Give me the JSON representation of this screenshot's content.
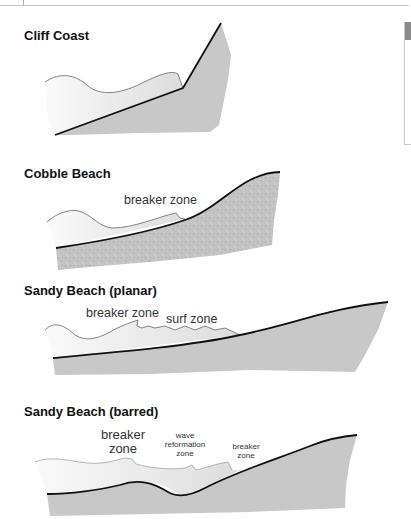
{
  "colors": {
    "water_light": "#f7f7f7",
    "water": "#e2e2e2",
    "land": "#c8c8c8",
    "shoreline": "#111111"
  },
  "sections": [
    {
      "title": "Cliff Coast",
      "labels": []
    },
    {
      "title": "Cobble Beach",
      "labels": [
        {
          "text": "breaker zone"
        }
      ]
    },
    {
      "title": "Sandy Beach (planar)",
      "labels": [
        {
          "text": "breaker zone"
        },
        {
          "text": "surf zone"
        }
      ]
    },
    {
      "title": "Sandy Beach (barred)",
      "labels": [
        {
          "line1": "breaker",
          "line2": "zone"
        },
        {
          "line1": "wave",
          "line2": "reformation",
          "line3": "zone"
        },
        {
          "line1": "breaker",
          "line2": "zone"
        }
      ]
    }
  ]
}
